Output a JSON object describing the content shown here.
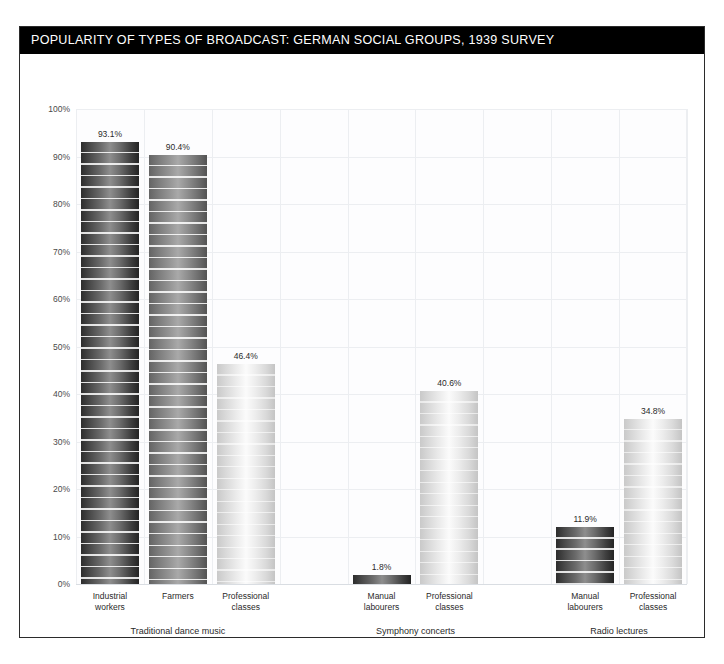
{
  "title": "POPULARITY OF TYPES OF BROADCAST: GERMAN SOCIAL GROUPS, 1939 SURVEY",
  "chart_data": {
    "type": "bar",
    "title": "POPULARITY OF TYPES OF BROADCAST: GERMAN SOCIAL GROUPS, 1939 SURVEY",
    "xlabel": "",
    "ylabel": "",
    "ylim": [
      0,
      100
    ],
    "yticks": [
      "0%",
      "10%",
      "20%",
      "30%",
      "40%",
      "50%",
      "60%",
      "70%",
      "80%",
      "90%",
      "100%"
    ],
    "ytick_values": [
      0,
      10,
      20,
      30,
      40,
      50,
      60,
      70,
      80,
      90,
      100
    ],
    "grid": true,
    "legend": "none",
    "value_suffix": "%",
    "groups": [
      {
        "name": "Traditional dance music",
        "categories": [
          "Industrial workers",
          "Farmers",
          "Professional classes"
        ],
        "values": [
          93.1,
          90.4,
          46.4
        ]
      },
      {
        "name": "Symphony concerts",
        "categories": [
          "Manual labourers",
          "Professional classes"
        ],
        "values": [
          1.8,
          40.6
        ]
      },
      {
        "name": "Radio lectures",
        "categories": [
          "Manual labourers",
          "Professional classes"
        ],
        "values": [
          11.9,
          34.8
        ]
      }
    ],
    "bars": [
      {
        "slot": 0,
        "label_line1": "Industrial",
        "label_line2": "workers",
        "value": 93.1,
        "value_label": "93.1%",
        "tone": "dark",
        "group": "Traditional dance music"
      },
      {
        "slot": 1,
        "label_line1": "Farmers",
        "label_line2": "",
        "value": 90.4,
        "value_label": "90.4%",
        "tone": "mid",
        "group": "Traditional dance music"
      },
      {
        "slot": 2,
        "label_line1": "Professional",
        "label_line2": "classes",
        "value": 46.4,
        "value_label": "46.4%",
        "tone": "light",
        "group": "Traditional dance music"
      },
      {
        "slot": 4,
        "label_line1": "Manual",
        "label_line2": "labourers",
        "value": 1.8,
        "value_label": "1.8%",
        "tone": "dark",
        "group": "Symphony concerts"
      },
      {
        "slot": 5,
        "label_line1": "Professional",
        "label_line2": "classes",
        "value": 40.6,
        "value_label": "40.6%",
        "tone": "light",
        "group": "Symphony concerts"
      },
      {
        "slot": 7,
        "label_line1": "Manual",
        "label_line2": "labourers",
        "value": 11.9,
        "value_label": "11.9%",
        "tone": "dark",
        "group": "Radio lectures"
      },
      {
        "slot": 8,
        "label_line1": "Professional",
        "label_line2": "classes",
        "value": 34.8,
        "value_label": "34.8%",
        "tone": "light",
        "group": "Radio lectures"
      }
    ],
    "group_labels": [
      {
        "text": "Traditional dance music",
        "center_slot": 1
      },
      {
        "text": "Symphony concerts",
        "center_slot": 4.5
      },
      {
        "text": "Radio lectures",
        "center_slot": 7.5
      }
    ]
  },
  "colors": {
    "title_bar_bg": "#000000",
    "title_text": "#ffffff",
    "frame_border": "#2b2b2b",
    "grid": "#eceef1",
    "plot_bg": "#fdfdfe",
    "tick_text": "#4a4a4a",
    "label_text": "#2a2a2a"
  }
}
